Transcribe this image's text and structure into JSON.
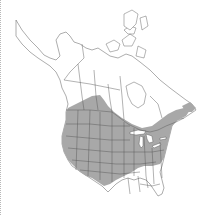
{
  "map": {
    "region": "North America",
    "type": "species range map",
    "range_color": "#a8a8a8",
    "land_color": "#ffffff",
    "border_color": "#555555",
    "background_color": "#ffffff",
    "range_description": "Shaded distribution covering western and central United States, southern Canadian prairies, Great Lakes region and northeastern US/Maritimes; excludes southeastern US and northern Canada"
  }
}
